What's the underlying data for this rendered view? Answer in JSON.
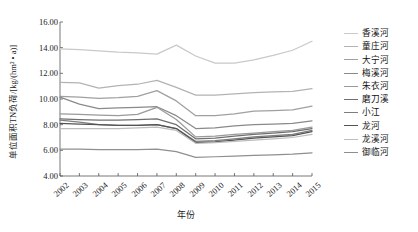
{
  "axes": {
    "ylabel": "单位面积TN负荷/[kg/(hm² • a)]",
    "xlabel": "年份",
    "yticks": [
      "4.00",
      "6.00",
      "8.00",
      "10.00",
      "12.00",
      "14.00",
      "16.00"
    ],
    "xticks": [
      "2002",
      "2003",
      "2004",
      "2005",
      "2006",
      "2007",
      "2008",
      "2009",
      "2010",
      "2011",
      "2012",
      "2013",
      "2014",
      "2015"
    ]
  },
  "legend": {
    "items": [
      {
        "label": "香溪河",
        "color": "#c9c9c9"
      },
      {
        "label": "童庄河",
        "color": "#b3b3b3"
      },
      {
        "label": "大宁河",
        "color": "#a0a0a0"
      },
      {
        "label": "梅溪河",
        "color": "#8a8a8a"
      },
      {
        "label": "朱衣河",
        "color": "#9a9a9a"
      },
      {
        "label": "磨刀溪",
        "color": "#6f6f6f"
      },
      {
        "label": "小江",
        "color": "#7d7d7d"
      },
      {
        "label": "龙河",
        "color": "#545454"
      },
      {
        "label": "龙溪河",
        "color": "#bdbdbd"
      },
      {
        "label": "御临河",
        "color": "#8f8f8f"
      }
    ]
  },
  "chart_data": {
    "type": "line",
    "title": "",
    "xlabel": "年份",
    "ylabel": "单位面积TN负荷/[kg/(hm² • a)]",
    "x": [
      2002,
      2003,
      2004,
      2005,
      2006,
      2007,
      2008,
      2009,
      2010,
      2011,
      2012,
      2013,
      2014,
      2015
    ],
    "ylim": [
      4.0,
      16.0
    ],
    "xlim": [
      2002,
      2015
    ],
    "grid": false,
    "legend_position": "right",
    "series": [
      {
        "name": "香溪河",
        "color": "#c9c9c9",
        "values": [
          13.9,
          13.85,
          13.75,
          13.65,
          13.6,
          13.5,
          14.2,
          13.35,
          12.8,
          12.8,
          13.05,
          13.4,
          13.8,
          14.5
        ]
      },
      {
        "name": "童庄河",
        "color": "#b3b3b3",
        "values": [
          11.3,
          11.25,
          10.85,
          11.05,
          11.15,
          11.45,
          10.9,
          10.3,
          10.3,
          10.4,
          10.5,
          10.55,
          10.6,
          10.8
        ]
      },
      {
        "name": "大宁河",
        "color": "#a0a0a0",
        "values": [
          10.2,
          10.15,
          10.05,
          10.1,
          10.2,
          10.65,
          9.85,
          8.7,
          8.7,
          8.85,
          9.05,
          9.1,
          9.15,
          9.45
        ]
      },
      {
        "name": "梅溪河",
        "color": "#8a8a8a",
        "values": [
          10.15,
          9.6,
          9.25,
          9.3,
          9.35,
          9.4,
          8.7,
          7.7,
          7.75,
          7.9,
          8.0,
          8.05,
          8.1,
          8.3
        ]
      },
      {
        "name": "朱衣河",
        "color": "#9a9a9a",
        "values": [
          8.85,
          8.8,
          8.75,
          8.7,
          8.8,
          9.35,
          8.4,
          7.05,
          7.1,
          7.25,
          7.35,
          7.45,
          7.55,
          7.8
        ]
      },
      {
        "name": "磨刀溪",
        "color": "#6f6f6f",
        "values": [
          8.45,
          8.4,
          8.35,
          8.35,
          8.4,
          8.45,
          8.0,
          6.9,
          6.95,
          7.1,
          7.25,
          7.35,
          7.45,
          7.7
        ]
      },
      {
        "name": "小江",
        "color": "#7d7d7d",
        "values": [
          8.35,
          8.2,
          8.0,
          7.95,
          7.95,
          8.0,
          7.7,
          6.7,
          6.75,
          6.9,
          7.05,
          7.15,
          7.25,
          7.55
        ]
      },
      {
        "name": "龙河",
        "color": "#545454",
        "values": [
          8.1,
          8.05,
          8.0,
          7.95,
          7.95,
          8.0,
          7.7,
          6.6,
          6.65,
          6.8,
          6.95,
          7.05,
          7.15,
          7.45
        ]
      },
      {
        "name": "龙溪河",
        "color": "#bdbdbd",
        "values": [
          7.7,
          7.7,
          7.7,
          7.7,
          7.75,
          7.8,
          7.55,
          6.55,
          6.6,
          6.7,
          6.8,
          6.9,
          7.0,
          7.25
        ]
      },
      {
        "name": "御临河",
        "color": "#8f8f8f",
        "values": [
          6.1,
          6.1,
          6.05,
          6.05,
          6.05,
          6.1,
          5.9,
          5.45,
          5.5,
          5.55,
          5.6,
          5.65,
          5.7,
          5.8
        ]
      }
    ]
  }
}
